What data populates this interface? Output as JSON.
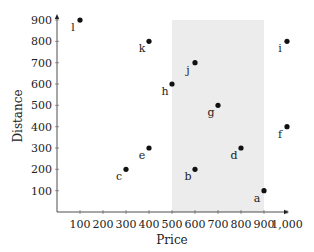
{
  "chart_data": {
    "type": "scatter",
    "title": "",
    "xlabel": "Price",
    "ylabel": "Distance",
    "xlim": [
      0,
      1000
    ],
    "ylim": [
      0,
      900
    ],
    "x_ticks": [
      100,
      200,
      300,
      400,
      500,
      600,
      700,
      800,
      900,
      1000
    ],
    "x_tick_labels": [
      "100",
      "200",
      "300",
      "400",
      "500",
      "600",
      "700",
      "800",
      "900",
      "1,000"
    ],
    "y_ticks": [
      100,
      200,
      300,
      400,
      500,
      600,
      700,
      800,
      900
    ],
    "y_tick_labels": [
      "100",
      "200",
      "300",
      "400",
      "500",
      "600",
      "700",
      "800",
      "900"
    ],
    "grid": false,
    "legend": null,
    "shaded_region": {
      "x_from": 500,
      "x_to": 900,
      "y_from": 0,
      "y_to": 900,
      "color": "#ececec"
    },
    "points": [
      {
        "label": "a",
        "x": 900,
        "y": 100
      },
      {
        "label": "b",
        "x": 600,
        "y": 200
      },
      {
        "label": "c",
        "x": 300,
        "y": 200
      },
      {
        "label": "d",
        "x": 800,
        "y": 300
      },
      {
        "label": "e",
        "x": 400,
        "y": 300
      },
      {
        "label": "f",
        "x": 1000,
        "y": 400
      },
      {
        "label": "g",
        "x": 700,
        "y": 500
      },
      {
        "label": "h",
        "x": 500,
        "y": 600
      },
      {
        "label": "i",
        "x": 1000,
        "y": 800
      },
      {
        "label": "j",
        "x": 600,
        "y": 700
      },
      {
        "label": "k",
        "x": 400,
        "y": 800
      },
      {
        "label": "l",
        "x": 100,
        "y": 900
      }
    ],
    "marker_color": "#111111",
    "label_position": "below left"
  }
}
